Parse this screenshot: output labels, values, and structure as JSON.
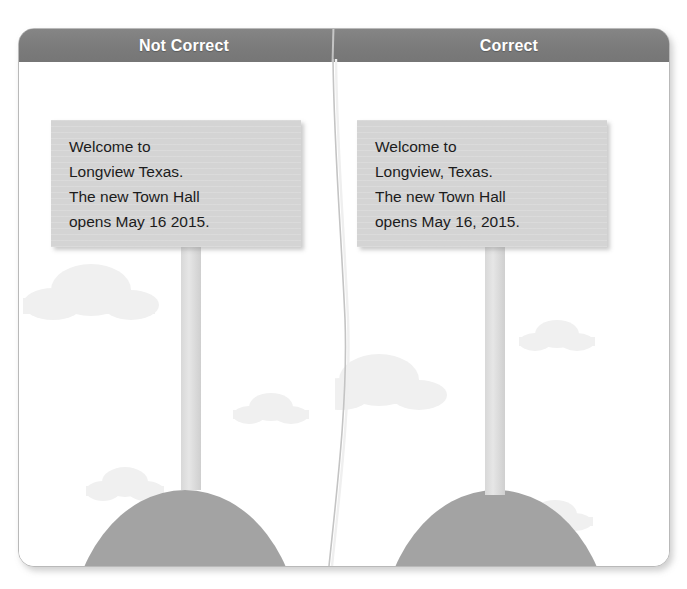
{
  "figure": {
    "type": "comparison-card",
    "columns": [
      {
        "id": "not-correct",
        "header": "Not Correct"
      },
      {
        "id": "correct",
        "header": "Correct"
      }
    ]
  },
  "colors": {
    "header_bar": "#7e7e7e",
    "header_text": "#ffffff",
    "card_border": "#b9b9b9",
    "card_background": "#ffffff",
    "sign_board": "#d4d4d4",
    "sign_post": "#dcdcdc",
    "ground_hill": "#a3a3a3",
    "cloud": "#f0f0f0",
    "body_text": "#1c1c1c"
  },
  "panels": {
    "not_correct": {
      "header": "Not Correct",
      "sign_lines": [
        "Welcome to",
        "Longview Texas.",
        "The new Town Hall",
        "opens May 16 2015."
      ],
      "clouds": [
        {
          "name": "cloud-large",
          "left": 30,
          "top": 205,
          "width": 96,
          "height": 34
        },
        {
          "name": "cloud-small",
          "left": 225,
          "top": 330,
          "width": 56,
          "height": 22
        },
        {
          "name": "cloud-medium",
          "left": 78,
          "top": 405,
          "width": 62,
          "height": 24
        }
      ]
    },
    "correct": {
      "header": "Correct",
      "sign_lines": [
        "Welcome to",
        "Longview, Texas.",
        "The new Town Hall",
        "opens May 16, 2015."
      ],
      "clouds": [
        {
          "name": "cloud-small-top",
          "left": 192,
          "top": 258,
          "width": 56,
          "height": 22
        },
        {
          "name": "cloud-large",
          "left": -10,
          "top": 302,
          "width": 108,
          "height": 38
        },
        {
          "name": "cloud-small-bottom",
          "left": 190,
          "top": 440,
          "width": 56,
          "height": 22
        }
      ]
    }
  }
}
